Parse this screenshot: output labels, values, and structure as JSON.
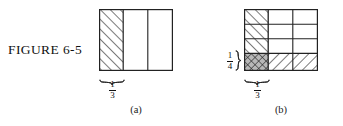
{
  "figure": {
    "label": "FIGURE 6-5",
    "caption_a": "(a)",
    "caption_b": "(b)"
  },
  "panel_a": {
    "name": "rectangle-divided-in-thirds",
    "columns": 3,
    "rows": 1,
    "shaded_columns": [
      0
    ],
    "hatch_style": "forward-diagonal",
    "bottom_label": {
      "numerator": "1",
      "denominator": "3"
    },
    "brace_spans": "first-column"
  },
  "panel_b": {
    "name": "rectangle-divided-in-thirds-and-fourths",
    "columns": 3,
    "rows": 4,
    "forward_hatched_cells": [
      {
        "row": 0,
        "col": 0
      },
      {
        "row": 1,
        "col": 0
      },
      {
        "row": 2,
        "col": 0
      }
    ],
    "backward_hatched_cells": [
      {
        "row": 3,
        "col": 1
      },
      {
        "row": 3,
        "col": 2
      }
    ],
    "cross_hatched_cells": [
      {
        "row": 3,
        "col": 0
      }
    ],
    "bottom_label": {
      "numerator": "1",
      "denominator": "3"
    },
    "left_label": {
      "numerator": "1",
      "denominator": "4"
    },
    "brace_spans_bottom": "first-column",
    "brace_spans_left": "bottom-row"
  },
  "colors": {
    "stroke": "#222222",
    "hatch": "#333333",
    "crosshatch_fill": "#9a9a9a",
    "background": "#ffffff",
    "text": "#111111"
  }
}
